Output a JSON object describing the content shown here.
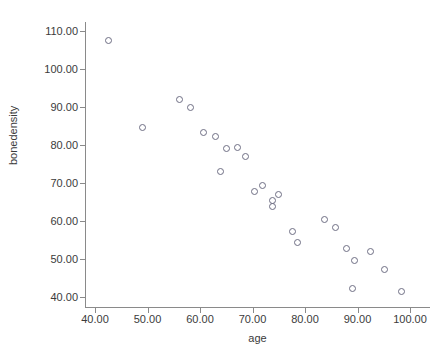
{
  "chart_data": {
    "type": "scatter",
    "title": "",
    "xlabel": "age",
    "ylabel": "bonedensity",
    "xlim": [
      36,
      103
    ],
    "ylim": [
      37,
      113
    ],
    "xticks": [
      "40.00",
      "50.00",
      "60.00",
      "70.00",
      "80.00",
      "90.00",
      "100.00"
    ],
    "xtick_values": [
      40,
      50,
      60,
      70,
      80,
      90,
      100
    ],
    "yticks": [
      "40.00",
      "50.00",
      "60.00",
      "70.00",
      "80.00",
      "90.00",
      "100.00",
      "110.00"
    ],
    "ytick_values": [
      40,
      50,
      60,
      70,
      80,
      90,
      100,
      110
    ],
    "grid": false,
    "legend": null,
    "marker": "open-circle",
    "marker_color": "#6e6e84",
    "axis_color": "#8a8a8a",
    "text_color": "#3b3b3b",
    "background": "#ffffff",
    "x": [
      42.5,
      49.0,
      56.0,
      58.0,
      60.5,
      62.8,
      63.8,
      65.0,
      67.0,
      68.5,
      70.3,
      71.8,
      73.8,
      73.8,
      74.8,
      77.5,
      78.5,
      83.7,
      85.8,
      87.9,
      89.0,
      89.4,
      92.3,
      95.1,
      98.3
    ],
    "y": [
      107.7,
      84.8,
      92.0,
      90.0,
      83.5,
      82.4,
      73.2,
      79.2,
      79.5,
      77.0,
      68.0,
      69.5,
      65.5,
      64.0,
      67.0,
      57.5,
      54.5,
      60.5,
      58.5,
      53.0,
      42.5,
      49.8,
      52.0,
      47.5,
      41.5
    ],
    "n_points": 25
  }
}
